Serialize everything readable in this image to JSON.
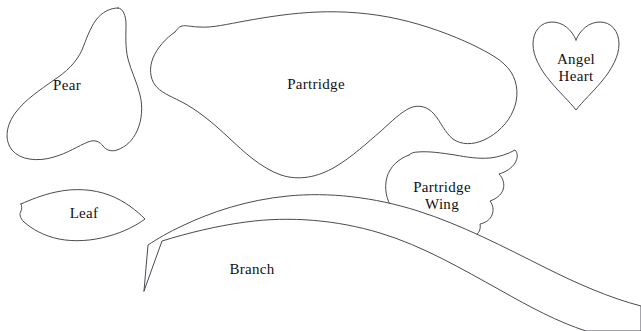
{
  "sheet": {
    "title": "Appliqué Pattern Template Sheet",
    "width": 641,
    "height": 331,
    "background_color": "#ffffff",
    "outline_color": "#4a4a52",
    "label_color": "#111114"
  },
  "pieces": [
    {
      "id": "pear",
      "label": "Pear",
      "label_x": 67,
      "label_y": 85,
      "font_size": 15,
      "outline": "M 118 8 C 110 8 102 12 96 20 C 90 28 86 40 82 50 C 76 63 66 72 54 80 C 40 90 26 99 16 112 C 6 125 4 140 12 150 C 20 160 38 162 54 157 C 68 153 78 146 88 142 C 95 139 100 142 103 146 C 106 150 111 152 117 150 C 126 147 133 140 137 131 C 142 120 143 107 140 95 C 137 82 131 71 128 59 C 125 47 126 34 126 24 C 126 16 123 8 118 8 Z"
    },
    {
      "id": "partridge",
      "label": "Partridge",
      "label_x": 316,
      "label_y": 84,
      "font_size": 15,
      "outline": "M 175 32 C 166 38 157 48 153 58 C 149 68 150 78 155 85 C 160 92 170 96 180 101 C 196 109 212 122 228 137 C 244 152 261 168 281 175 C 299 181 318 177 335 167 C 352 157 367 143 381 131 C 392 121 401 112 410 108 C 419 104 428 107 434 114 C 441 122 445 133 453 139 C 461 145 473 145 484 140 C 497 134 508 123 513 111 C 519 98 518 83 511 72 C 503 60 489 53 473 45 C 452 35 425 25 398 19 C 371 13 344 11 318 12 C 292 13 267 17 245 21 C 228 24 212 28 200 27 C 192 27 186 25 182 26 C 178 27 177 30 175 32 Z"
    },
    {
      "id": "angel-heart",
      "label": "Angel\nHeart",
      "label_x": 576,
      "label_y": 68,
      "font_size": 15,
      "outline": "M 576 40 C 572 30 563 22 552 22 C 541 22 533 31 533 44 C 533 56 540 69 550 81 C 559 92 570 102 576 110 C 582 102 593 92 602 81 C 612 69 619 56 619 44 C 619 31 611 22 600 22 C 589 22 580 30 576 40 Z"
    },
    {
      "id": "leaf",
      "label": "Leaf",
      "label_x": 84,
      "label_y": 213,
      "font_size": 15,
      "outline": "M 21 204 C 30 200 42 195 56 192 C 74 188 93 189 109 195 C 125 201 137 211 145 219 C 137 225 124 232 109 236 C 92 241 74 242 59 239 C 44 236 32 229 24 222 C 20 218 19 214 21 211 C 22 209 22 206 21 204 Z"
    },
    {
      "id": "partridge-wing",
      "label": "Partridge\nWing",
      "label_x": 442,
      "label_y": 196,
      "font_size": 15,
      "outline": "M 409 155 C 398 159 390 167 387 177 C 384 188 386 200 393 209 C 400 218 411 224 423 228 C 435 232 448 233 458 231 C 462 236 469 238 474 236 C 479 234 481 229 480 224 C 485 223 490 220 492 215 C 494 210 493 205 490 201 C 496 199 501 195 503 190 C 505 184 503 178 499 174 C 506 172 512 168 515 163 C 518 158 518 153 515 150 C 508 154 499 157 490 158 C 478 159 466 157 455 155 C 442 153 428 151 418 152 C 414 152 411 153 409 155 Z"
    },
    {
      "id": "branch",
      "label": "Branch",
      "label_x": 252,
      "label_y": 269,
      "font_size": 15,
      "outline": "M 144 291 L 162 241 C 188 233 216 226 246 222 C 290 216 337 220 380 233 C 423 246 462 269 500 290 C 530 307 558 322 586 331 L 641 331 L 641 306 C 610 298 578 284 546 268 C 504 247 462 225 418 211 C 374 197 329 192 288 196 C 247 200 211 212 182 226 C 169 232 157 239 148 245 L 144 291 Z"
    }
  ]
}
